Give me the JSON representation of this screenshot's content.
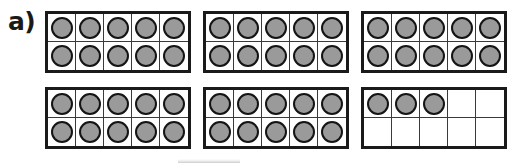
{
  "worksheet": {
    "part_label": "a)",
    "frame_capacity": 10,
    "columns": 5,
    "rows": 2,
    "total_counters": 53,
    "counter_color": "#9a9a9a",
    "counter_outline_color": "#141414",
    "frame_border_color": "#1a1a1a",
    "grid_line_color": "#3a3a3a",
    "background_color": "#ffffff",
    "frames": [
      {
        "label": "ten-frame-1",
        "filled": 10
      },
      {
        "label": "ten-frame-2",
        "filled": 10
      },
      {
        "label": "ten-frame-3",
        "filled": 10
      },
      {
        "label": "ten-frame-4",
        "filled": 10
      },
      {
        "label": "ten-frame-5",
        "filled": 10
      },
      {
        "label": "ten-frame-6",
        "filled": 3
      }
    ]
  }
}
